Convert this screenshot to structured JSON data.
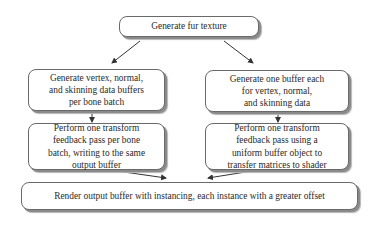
{
  "diagram": {
    "type": "flowchart",
    "nodes": {
      "top": {
        "label": "Generate fur texture"
      },
      "left_1": {
        "label": "Generate vertex, normal,\nand skinning data buffers\nper bone batch"
      },
      "right_1": {
        "label": "Generate one buffer each\nfor vertex, normal,\nand skinning data"
      },
      "left_2": {
        "label": "Perform one transform\nfeedback pass per bone\nbatch, writing to the same\noutput buffer"
      },
      "right_2": {
        "label": "Perform one transform\nfeedback pass using a\nuniform buffer object to\ntransfer matrices to shader"
      },
      "bottom": {
        "label": "Render output buffer with instancing, each instance with a greater offset"
      }
    },
    "edges": [
      {
        "from": "top",
        "to": "left_1"
      },
      {
        "from": "top",
        "to": "right_1"
      },
      {
        "from": "left_1",
        "to": "left_2"
      },
      {
        "from": "right_1",
        "to": "right_2"
      },
      {
        "from": "left_2",
        "to": "bottom"
      },
      {
        "from": "right_2",
        "to": "bottom"
      }
    ],
    "colors": {
      "border": "#6a6a6a",
      "shadow": "#8a8a8a",
      "arrow": "#333333",
      "text": "#2a2a2a"
    }
  }
}
